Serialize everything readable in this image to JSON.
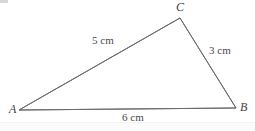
{
  "figure": {
    "kind": "geometry-diagram",
    "shape": "triangle",
    "background_color": "#ffffff",
    "stroke_color": "#6b6b70",
    "stroke_width": 1,
    "text_color": "#48484d",
    "width": 255,
    "height": 131
  },
  "vertices": [
    {
      "name": "A",
      "label": "A",
      "x": 19,
      "y": 110
    },
    {
      "name": "B",
      "label": "B",
      "x": 236,
      "y": 108
    },
    {
      "name": "C",
      "label": "C",
      "x": 180,
      "y": 18
    }
  ],
  "sides": [
    {
      "name": "AC",
      "from": "A",
      "to": "C",
      "label": "5 cm",
      "length": 5,
      "unit": "cm"
    },
    {
      "name": "CB",
      "from": "C",
      "to": "B",
      "label": "3 cm",
      "length": 3,
      "unit": "cm"
    },
    {
      "name": "AB",
      "from": "A",
      "to": "B",
      "label": "6 cm",
      "length": 6,
      "unit": "cm"
    }
  ],
  "labels": {
    "vertex_a": "A",
    "vertex_b": "B",
    "vertex_c": "C",
    "side_ac": "5 cm",
    "side_cb": "3 cm",
    "side_ab": "6 cm"
  }
}
